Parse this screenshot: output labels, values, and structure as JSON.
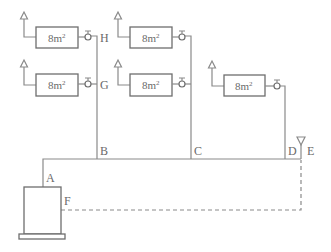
{
  "diagram": {
    "type": "heating-pipe-schematic",
    "radiators": [
      {
        "id": "r1",
        "label": "8m",
        "exp": "2",
        "column": "B",
        "row": "top",
        "valve_node": "H"
      },
      {
        "id": "r2",
        "label": "8m",
        "exp": "2",
        "column": "B",
        "row": "middle",
        "valve_node": "G"
      },
      {
        "id": "r3",
        "label": "8m",
        "exp": "2",
        "column": "C",
        "row": "top"
      },
      {
        "id": "r4",
        "label": "8m",
        "exp": "2",
        "column": "C",
        "row": "middle"
      },
      {
        "id": "r5",
        "label": "8m",
        "exp": "2",
        "column": "D",
        "row": "middle"
      }
    ],
    "nodes": {
      "A": "A",
      "B": "B",
      "C": "C",
      "D": "D",
      "E": "E",
      "F": "F",
      "G": "G",
      "H": "H"
    },
    "colors": {
      "line": "#8a8a8a",
      "box": "#6e6e6e",
      "text": "#6a6a6a",
      "background": "#ffffff"
    }
  }
}
